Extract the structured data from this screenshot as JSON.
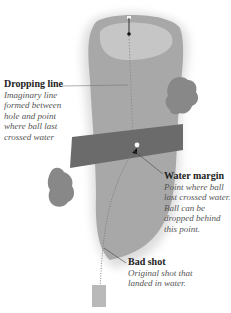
{
  "labels": {
    "dropping_line": {
      "title": "Dropping line",
      "description": "Imaginary line formed between hole and point where ball last crossed water"
    },
    "water_margin": {
      "title": "Water margin",
      "description": "Point where ball last crossed water. Ball can be dropped behind this point."
    },
    "bad_shot": {
      "title": "Bad shot",
      "description": "Original shot that landed in water."
    }
  },
  "colors": {
    "fairway": "#a9a9a9",
    "green": "#c4c4c4",
    "water": "#6e6e6e",
    "rough_shadow": "#e2e2e2",
    "trees": "#8a8a8a",
    "tee": "#b8b8b8",
    "leader_line": "#555555"
  }
}
